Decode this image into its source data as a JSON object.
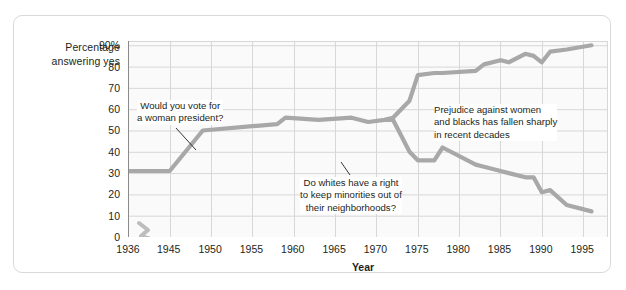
{
  "figure": {
    "y_axis_caption": "Percentage\nanswering yes",
    "x_axis_caption": "Year"
  },
  "chart_data": {
    "type": "line",
    "title": "",
    "subtitle": "",
    "xlabel": "Year",
    "ylabel": "Percentage answering yes",
    "xlim": [
      1936,
      1998
    ],
    "ylim": [
      0,
      92
    ],
    "grid": true,
    "legend_position": "none",
    "xtick_labels": [
      "1936",
      "1945",
      "1950",
      "1955",
      "1960",
      "1965",
      "1970",
      "1975",
      "1980",
      "1985",
      "1990",
      "1995"
    ],
    "xticks": [
      1936,
      1945,
      1950,
      1955,
      1960,
      1965,
      1970,
      1975,
      1980,
      1985,
      1990,
      1995
    ],
    "ytick_labels": [
      "0",
      "10",
      "20",
      "30",
      "40",
      "50",
      "60",
      "70",
      "80",
      "90%"
    ],
    "yticks": [
      0,
      10,
      20,
      30,
      40,
      50,
      60,
      70,
      80,
      90
    ],
    "line_color": "#a8a8a8",
    "grid_color": "#d7d7d7",
    "axis_color": "#8a8a8a",
    "axis_break_note": "broken x-axis between 1936 and 1945",
    "series": [
      {
        "name": "Would you vote for a woman president?",
        "color": "#a8a8a8",
        "x": [
          1936,
          1945,
          1949,
          1955,
          1958,
          1959,
          1963,
          1967,
          1969,
          1971,
          1972,
          1974,
          1975,
          1977,
          1978,
          1982,
          1983,
          1985,
          1986,
          1988,
          1989,
          1990,
          1991,
          1993,
          1996
        ],
        "y": [
          31,
          31,
          50,
          52,
          53,
          56,
          55,
          56,
          54,
          55,
          56,
          64,
          76,
          77,
          77,
          78,
          81,
          83,
          82,
          86,
          85,
          82,
          87,
          88,
          90
        ]
      },
      {
        "name": "Do whites have a right to keep minorities out of their neighborhoods?",
        "color": "#a8a8a8",
        "x": [
          1971,
          1972,
          1974,
          1975,
          1977,
          1978,
          1982,
          1983,
          1985,
          1986,
          1988,
          1989,
          1990,
          1991,
          1993,
          1996
        ],
        "y": [
          55,
          55,
          40,
          36,
          36,
          42,
          34,
          33,
          31,
          30,
          28,
          28,
          21,
          22,
          15,
          12
        ]
      }
    ],
    "annotations": [
      {
        "name": "woman-president-annotation",
        "text": "Would you vote for\na woman president?",
        "target_x": 1947,
        "target_y": 41
      },
      {
        "name": "white-neighborhoods-annotation",
        "text": "Do whites have a right\nto keep minorities out of\ntheir neighborhoods?",
        "target_x": 1975,
        "target_y": 36
      },
      {
        "name": "prejudice-annotation",
        "text": "Prejudice against women\nand blacks has fallen sharply\nin recent decades",
        "target_x": null,
        "target_y": null
      }
    ]
  }
}
